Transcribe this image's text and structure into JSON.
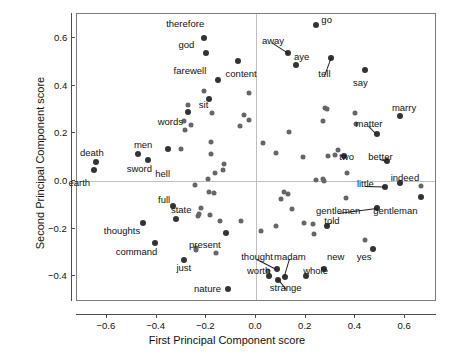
{
  "chart_data": {
    "type": "scatter",
    "title": "",
    "xlabel": "First Principal Component score",
    "ylabel": "Second Principal Component score",
    "xlim": [
      -0.72,
      0.72
    ],
    "ylim": [
      -0.5,
      0.7
    ],
    "xticks": [
      -0.6,
      -0.4,
      -0.2,
      0.0,
      0.2,
      0.4,
      0.6
    ],
    "xtick_labels": [
      "−0.6",
      "−0.4",
      "−0.2",
      "0.0",
      "0.2",
      "0.4",
      "0.6"
    ],
    "yticks": [
      0.6,
      0.4,
      0.2,
      0.0,
      -0.2,
      -0.4
    ],
    "ytick_labels": [
      "0.6",
      "0.4",
      "0.2",
      "0.0",
      "−0.2",
      "−0.4"
    ],
    "grid": false,
    "reference_lines": {
      "x": 0.0,
      "y": 0.0
    },
    "marker_color": "#666666",
    "labeled_points": [
      {
        "label": "therefore",
        "x": -0.211,
        "y": 0.598,
        "lx": -0.285,
        "ly": 0.66,
        "leader": false
      },
      {
        "label": "go",
        "x": 0.243,
        "y": 0.655,
        "lx": 0.285,
        "ly": 0.675,
        "leader": false
      },
      {
        "label": "god",
        "x": -0.201,
        "y": 0.536,
        "lx": -0.28,
        "ly": 0.568,
        "leader": false
      },
      {
        "label": "away",
        "x": 0.13,
        "y": 0.535,
        "lx": 0.068,
        "ly": 0.585,
        "leader": true
      },
      {
        "label": "aye",
        "x": 0.161,
        "y": 0.488,
        "lx": 0.183,
        "ly": 0.52,
        "leader": false
      },
      {
        "label": "tell",
        "x": 0.302,
        "y": 0.517,
        "lx": 0.275,
        "ly": 0.448,
        "leader": true
      },
      {
        "label": "content",
        "x": -0.073,
        "y": 0.502,
        "lx": -0.06,
        "ly": 0.447,
        "leader": false
      },
      {
        "label": "say",
        "x": 0.44,
        "y": 0.466,
        "lx": 0.42,
        "ly": 0.412,
        "leader": false
      },
      {
        "label": "farewell",
        "x": -0.154,
        "y": 0.423,
        "lx": -0.265,
        "ly": 0.462,
        "leader": false
      },
      {
        "label": "sit",
        "x": -0.191,
        "y": 0.345,
        "lx": -0.21,
        "ly": 0.318,
        "leader": false
      },
      {
        "label": "marry",
        "x": 0.578,
        "y": 0.272,
        "lx": 0.595,
        "ly": 0.305,
        "leader": false
      },
      {
        "label": "matter",
        "x": 0.487,
        "y": 0.197,
        "lx": 0.455,
        "ly": 0.24,
        "leader": true
      },
      {
        "label": "words",
        "x": -0.275,
        "y": 0.288,
        "lx": -0.345,
        "ly": 0.247,
        "leader": false
      },
      {
        "label": "men",
        "x": -0.475,
        "y": 0.113,
        "lx": -0.455,
        "ly": 0.15,
        "leader": false
      },
      {
        "label": "death",
        "x": -0.645,
        "y": 0.077,
        "lx": -0.66,
        "ly": 0.117,
        "leader": false
      },
      {
        "label": "two",
        "x": 0.355,
        "y": 0.106,
        "lx": 0.365,
        "ly": 0.1,
        "leader": false
      },
      {
        "label": "better",
        "x": 0.525,
        "y": 0.084,
        "lx": 0.5,
        "ly": 0.1,
        "leader": true
      },
      {
        "label": "sword",
        "x": -0.435,
        "y": 0.086,
        "lx": -0.47,
        "ly": 0.051,
        "leader": false
      },
      {
        "label": "hell",
        "x": -0.355,
        "y": 0.132,
        "lx": -0.375,
        "ly": 0.03,
        "leader": false
      },
      {
        "label": "earth",
        "x": -0.65,
        "y": 0.046,
        "lx": -0.71,
        "ly": -0.01,
        "leader": false
      },
      {
        "label": "indeed",
        "x": 0.578,
        "y": -0.008,
        "lx": 0.6,
        "ly": 0.013,
        "leader": false
      },
      {
        "label": "little",
        "x": 0.52,
        "y": -0.026,
        "lx": 0.44,
        "ly": -0.015,
        "leader": true
      },
      {
        "label": "full",
        "x": -0.335,
        "y": -0.105,
        "lx": -0.37,
        "ly": -0.08,
        "leader": false
      },
      {
        "label": "state",
        "x": -0.32,
        "y": -0.16,
        "lx": -0.3,
        "ly": -0.122,
        "leader": false
      },
      {
        "label": "gentlemen",
        "x": 0.485,
        "y": -0.112,
        "lx": 0.33,
        "ly": -0.125,
        "leader": true
      },
      {
        "label": "gentleman",
        "x": 0.663,
        "y": -0.068,
        "lx": 0.56,
        "ly": -0.128,
        "leader": false
      },
      {
        "label": "thoughts",
        "x": -0.455,
        "y": -0.177,
        "lx": -0.54,
        "ly": -0.21,
        "leader": false
      },
      {
        "label": "told",
        "x": 0.285,
        "y": -0.188,
        "lx": 0.305,
        "ly": -0.167,
        "leader": true
      },
      {
        "label": "present",
        "x": -0.122,
        "y": -0.218,
        "lx": -0.205,
        "ly": -0.27,
        "leader": false
      },
      {
        "label": "command",
        "x": -0.408,
        "y": -0.262,
        "lx": -0.48,
        "ly": -0.3,
        "leader": false
      },
      {
        "label": "just",
        "x": -0.29,
        "y": -0.333,
        "lx": -0.29,
        "ly": -0.365,
        "leader": false
      },
      {
        "label": "yes",
        "x": 0.47,
        "y": -0.287,
        "lx": 0.435,
        "ly": -0.318,
        "leader": false
      },
      {
        "label": "new",
        "x": 0.275,
        "y": -0.368,
        "lx": 0.32,
        "ly": -0.318,
        "leader": false
      },
      {
        "label": "thought",
        "x": 0.083,
        "y": -0.368,
        "lx": 0.005,
        "ly": -0.318,
        "leader": true
      },
      {
        "label": "madam",
        "x": 0.115,
        "y": -0.403,
        "lx": 0.137,
        "ly": -0.318,
        "leader": true
      },
      {
        "label": "whole",
        "x": 0.202,
        "y": -0.4,
        "lx": 0.24,
        "ly": -0.378,
        "leader": false
      },
      {
        "label": "worth",
        "x": 0.053,
        "y": -0.398,
        "lx": 0.01,
        "ly": -0.378,
        "leader": false
      },
      {
        "label": "strange",
        "x": 0.088,
        "y": -0.417,
        "lx": 0.12,
        "ly": -0.45,
        "leader": true
      },
      {
        "label": "nature",
        "x": -0.112,
        "y": -0.455,
        "lx": -0.195,
        "ly": -0.452,
        "leader": false
      }
    ],
    "unlabeled_points": [
      {
        "x": -0.208,
        "y": 0.379
      },
      {
        "x": -0.272,
        "y": 0.32
      },
      {
        "x": -0.178,
        "y": 0.286
      },
      {
        "x": -0.288,
        "y": 0.251
      },
      {
        "x": -0.262,
        "y": 0.234
      },
      {
        "x": -0.285,
        "y": 0.212
      },
      {
        "x": -0.3,
        "y": 0.133
      },
      {
        "x": -0.18,
        "y": 0.161
      },
      {
        "x": -0.183,
        "y": 0.113
      },
      {
        "x": -0.163,
        "y": 0.031
      },
      {
        "x": -0.133,
        "y": 0.044
      },
      {
        "x": -0.128,
        "y": 0.069
      },
      {
        "x": -0.247,
        "y": -0.016
      },
      {
        "x": -0.195,
        "y": 0.006
      },
      {
        "x": -0.19,
        "y": -0.048
      },
      {
        "x": -0.168,
        "y": -0.053
      },
      {
        "x": -0.222,
        "y": -0.113
      },
      {
        "x": -0.228,
        "y": -0.14
      },
      {
        "x": -0.232,
        "y": -0.148
      },
      {
        "x": -0.185,
        "y": -0.143
      },
      {
        "x": -0.145,
        "y": -0.168
      },
      {
        "x": -0.242,
        "y": -0.282
      },
      {
        "x": -0.24,
        "y": -0.292
      },
      {
        "x": -0.16,
        "y": -0.302
      },
      {
        "x": -0.03,
        "y": 0.37
      },
      {
        "x": -0.048,
        "y": 0.276
      },
      {
        "x": -0.03,
        "y": 0.255
      },
      {
        "x": -0.063,
        "y": 0.23
      },
      {
        "x": 0.027,
        "y": 0.16
      },
      {
        "x": 0.133,
        "y": 0.205
      },
      {
        "x": 0.082,
        "y": 0.118
      },
      {
        "x": 0.19,
        "y": 0.098
      },
      {
        "x": 0.278,
        "y": 0.306
      },
      {
        "x": 0.285,
        "y": 0.303
      },
      {
        "x": 0.268,
        "y": 0.251
      },
      {
        "x": 0.4,
        "y": 0.285
      },
      {
        "x": 0.402,
        "y": 0.24
      },
      {
        "x": 0.33,
        "y": 0.13
      },
      {
        "x": 0.288,
        "y": 0.106
      },
      {
        "x": 0.318,
        "y": 0.108
      },
      {
        "x": 0.365,
        "y": 0.034
      },
      {
        "x": 0.243,
        "y": 0.005
      },
      {
        "x": 0.268,
        "y": 0.006
      },
      {
        "x": 0.272,
        "y": -0.002
      },
      {
        "x": 0.663,
        "y": -0.021
      },
      {
        "x": 0.36,
        "y": -0.073
      },
      {
        "x": 0.112,
        "y": -0.047
      },
      {
        "x": 0.13,
        "y": -0.055
      },
      {
        "x": 0.102,
        "y": -0.078
      },
      {
        "x": 0.145,
        "y": -0.118
      },
      {
        "x": 0.192,
        "y": -0.176
      },
      {
        "x": 0.228,
        "y": -0.18
      },
      {
        "x": 0.022,
        "y": -0.212
      },
      {
        "x": 0.08,
        "y": -0.188
      },
      {
        "x": 0.235,
        "y": -0.222
      },
      {
        "x": 0.438,
        "y": -0.25
      },
      {
        "x": -0.06,
        "y": -0.168
      },
      {
        "x": 0.05,
        "y": -0.378
      }
    ]
  },
  "axes": {
    "x_title": "First Principal Component score",
    "y_title": "Second Principal Component score"
  }
}
